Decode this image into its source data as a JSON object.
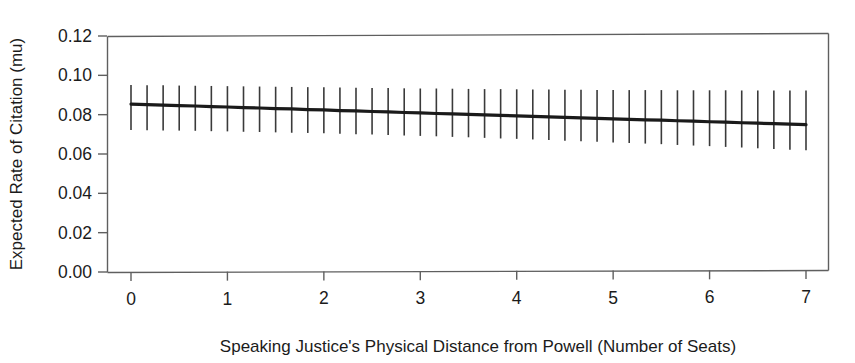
{
  "chart_data": {
    "type": "line",
    "title": "",
    "xlabel": "Speaking Justice's Physical Distance from Powell (Number of Seats)",
    "ylabel": "Expected Rate of Citation (mu)",
    "xlim": [
      0,
      7
    ],
    "ylim": [
      0.0,
      0.12
    ],
    "xticks": [
      0,
      1,
      2,
      3,
      4,
      5,
      6,
      7
    ],
    "xtick_labels": [
      "0",
      "1",
      "2",
      "3",
      "4",
      "5",
      "6",
      "7"
    ],
    "yticks": [
      0.0,
      0.02,
      0.04,
      0.06,
      0.08,
      0.1,
      0.12
    ],
    "ytick_labels": [
      "0.00",
      "0.02",
      "0.04",
      "0.06",
      "0.08",
      "0.10",
      "0.12"
    ],
    "grid": false,
    "legend": "none",
    "line_color": "#1a1a1a",
    "errorbar_color": "#3a3a3a",
    "series": [
      {
        "name": "Expected rate of citation",
        "x": [
          0,
          0.1667,
          0.3333,
          0.5,
          0.6667,
          0.8333,
          1,
          1.1667,
          1.3333,
          1.5,
          1.6667,
          1.8333,
          2,
          2.1667,
          2.3333,
          2.5,
          2.6667,
          2.8333,
          3,
          3.1667,
          3.3333,
          3.5,
          3.6667,
          3.8333,
          4,
          4.1667,
          4.3333,
          4.5,
          4.6667,
          4.8333,
          5,
          5.1667,
          5.3333,
          5.5,
          5.6667,
          5.8333,
          6,
          6.1667,
          6.3333,
          6.5,
          6.6667,
          6.8333,
          7
        ],
        "values": [
          0.0854,
          0.0851,
          0.0849,
          0.0846,
          0.0844,
          0.0841,
          0.0839,
          0.0836,
          0.0834,
          0.0831,
          0.0829,
          0.0826,
          0.0824,
          0.0821,
          0.0819,
          0.0816,
          0.0814,
          0.0811,
          0.0809,
          0.0806,
          0.0804,
          0.0801,
          0.0799,
          0.0796,
          0.0794,
          0.0791,
          0.0789,
          0.0786,
          0.0784,
          0.0781,
          0.0779,
          0.0776,
          0.0774,
          0.0772,
          0.0769,
          0.0767,
          0.0764,
          0.0762,
          0.0759,
          0.0757,
          0.0754,
          0.0752,
          0.0749
        ],
        "ci_lower": [
          0.0722,
          0.0721,
          0.072,
          0.0719,
          0.0718,
          0.0716,
          0.0715,
          0.0713,
          0.0712,
          0.071,
          0.0708,
          0.0707,
          0.0705,
          0.0703,
          0.0701,
          0.0699,
          0.0697,
          0.0694,
          0.0692,
          0.069,
          0.0687,
          0.0685,
          0.0682,
          0.0679,
          0.0677,
          0.0674,
          0.0671,
          0.0668,
          0.0665,
          0.0662,
          0.0659,
          0.0656,
          0.0653,
          0.065,
          0.0646,
          0.0643,
          0.064,
          0.0636,
          0.0633,
          0.0629,
          0.0626,
          0.0622,
          0.0619
        ],
        "ci_upper": [
          0.0951,
          0.095,
          0.0949,
          0.0948,
          0.0947,
          0.0946,
          0.0945,
          0.0944,
          0.0943,
          0.0942,
          0.0941,
          0.094,
          0.0939,
          0.0938,
          0.0937,
          0.0936,
          0.0935,
          0.0934,
          0.0933,
          0.0933,
          0.0932,
          0.0931,
          0.093,
          0.093,
          0.0929,
          0.0928,
          0.0928,
          0.0927,
          0.0927,
          0.0926,
          0.0926,
          0.0925,
          0.0925,
          0.0925,
          0.0924,
          0.0924,
          0.0924,
          0.0924,
          0.0923,
          0.0923,
          0.0923,
          0.0923,
          0.0923
        ]
      }
    ]
  }
}
